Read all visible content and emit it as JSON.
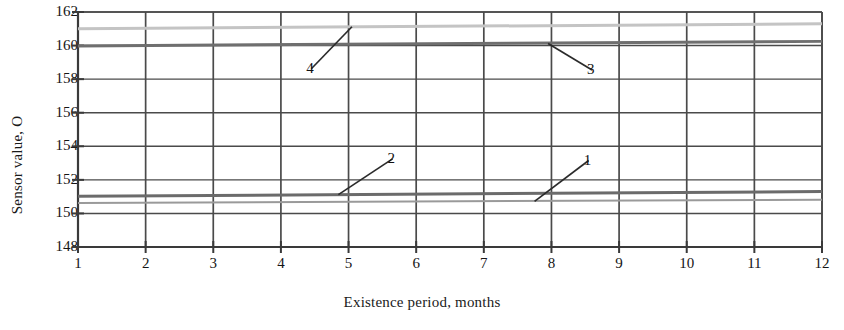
{
  "chart_data": {
    "type": "line",
    "title": "",
    "xlabel": "Existence period, months",
    "ylabel": "Sensor value, O",
    "xlim": [
      1,
      12
    ],
    "ylim": [
      148,
      162
    ],
    "grid": true,
    "legend_position": "inline-callouts",
    "x": [
      1,
      12
    ],
    "xticks": [
      "1",
      "2",
      "3",
      "4",
      "5",
      "6",
      "7",
      "8",
      "9",
      "10",
      "11",
      "12"
    ],
    "yticks": [
      "148",
      "150",
      "152",
      "154",
      "156",
      "158",
      "160",
      "162"
    ],
    "series": [
      {
        "name": "1",
        "label": "1",
        "color": "#9a9a9a",
        "width": 2.0,
        "values": [
          150.62,
          150.82
        ],
        "callout": {
          "x": 8.55,
          "y": 153.15,
          "leader_to_x": 7.75,
          "leader_to_y": 150.72
        }
      },
      {
        "name": "2",
        "label": "2",
        "color": "#6b6b6b",
        "width": 3.0,
        "values": [
          151.02,
          151.3
        ],
        "callout": {
          "x": 5.65,
          "y": 153.25,
          "leader_to_x": 4.85,
          "leader_to_y": 151.12
        }
      },
      {
        "name": "3",
        "label": "3",
        "color": "#6f6f6f",
        "width": 3.0,
        "values": [
          159.98,
          160.25
        ],
        "callout": {
          "x": 8.6,
          "y": 158.55,
          "leader_to_x": 7.95,
          "leader_to_y": 160.12
        }
      },
      {
        "name": "4",
        "label": "4",
        "color": "#c4c4c4",
        "width": 3.0,
        "values": [
          161.0,
          161.3
        ],
        "callout": {
          "x": 4.45,
          "y": 158.62,
          "leader_to_x": 5.05,
          "leader_to_y": 161.12
        }
      }
    ],
    "axis_color": "#3a3a3a",
    "grid_color": "#4a4a4a",
    "background": "#ffffff"
  }
}
